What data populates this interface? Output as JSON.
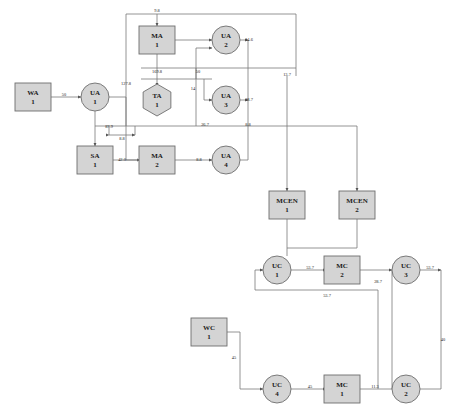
{
  "diagram": {
    "background": "#ffffff",
    "node_fill": "#d4d4d4",
    "node_stroke": "#6e6e6e",
    "edge_color": "#7a7a7a",
    "nodes": [
      {
        "id": "WA1",
        "line1": "WA",
        "line2": "1",
        "shape": "rect",
        "x": 33,
        "y": 97
      },
      {
        "id": "UA1",
        "line1": "UA",
        "line2": "1",
        "shape": "circle",
        "x": 95,
        "y": 97
      },
      {
        "id": "SA1",
        "line1": "SA",
        "line2": "1",
        "shape": "rect",
        "x": 95,
        "y": 160
      },
      {
        "id": "MA1",
        "line1": "MA",
        "line2": "1",
        "shape": "rect",
        "x": 157,
        "y": 40
      },
      {
        "id": "TA1",
        "line1": "TA",
        "line2": "1",
        "shape": "hexagon",
        "x": 157,
        "y": 100
      },
      {
        "id": "MA2",
        "line1": "MA",
        "line2": "2",
        "shape": "rect",
        "x": 157,
        "y": 160
      },
      {
        "id": "UA2",
        "line1": "UA",
        "line2": "2",
        "shape": "circle",
        "x": 226,
        "y": 40
      },
      {
        "id": "UA3",
        "line1": "UA",
        "line2": "3",
        "shape": "circle",
        "x": 226,
        "y": 100
      },
      {
        "id": "UA4",
        "line1": "UA",
        "line2": "4",
        "shape": "circle",
        "x": 226,
        "y": 160
      },
      {
        "id": "MCEN1",
        "line1": "MCEN",
        "line2": "1",
        "shape": "rect",
        "x": 287,
        "y": 205
      },
      {
        "id": "MCEN2",
        "line1": "MCEN",
        "line2": "2",
        "shape": "rect",
        "x": 357,
        "y": 205
      },
      {
        "id": "UC1",
        "line1": "UC",
        "line2": "1",
        "shape": "circle",
        "x": 277,
        "y": 270
      },
      {
        "id": "MC2",
        "line1": "MC",
        "line2": "2",
        "shape": "rect",
        "x": 342,
        "y": 270
      },
      {
        "id": "UC3",
        "line1": "UC",
        "line2": "3",
        "shape": "circle",
        "x": 406,
        "y": 270
      },
      {
        "id": "WC1",
        "line1": "WC",
        "line2": "1",
        "shape": "rect",
        "x": 209,
        "y": 332
      },
      {
        "id": "UC4",
        "line1": "UC",
        "line2": "4",
        "shape": "circle",
        "x": 277,
        "y": 389
      },
      {
        "id": "MC1",
        "line1": "MC",
        "line2": "1",
        "shape": "rect",
        "x": 342,
        "y": 389
      },
      {
        "id": "UC2",
        "line1": "UC",
        "line2": "2",
        "shape": "circle",
        "x": 406,
        "y": 389
      }
    ],
    "edge_labels": [
      {
        "id": "wa1-ua1",
        "text": "50",
        "x": 64,
        "y": 96
      },
      {
        "id": "ma1-top",
        "text": "9.8",
        "x": 157,
        "y": 12
      },
      {
        "id": "left-trunk",
        "text": "127.8",
        "x": 126,
        "y": 85
      },
      {
        "id": "ma1-ta1",
        "text": "169.8",
        "x": 157,
        "y": 73
      },
      {
        "id": "ta1-branch",
        "text": "50",
        "x": 198,
        "y": 73
      },
      {
        "id": "mid-vert",
        "text": "14",
        "x": 193,
        "y": 90
      },
      {
        "id": "ua1-sa1",
        "text": "87.9",
        "x": 109,
        "y": 128
      },
      {
        "id": "sa1-back",
        "text": "8.8",
        "x": 122,
        "y": 140
      },
      {
        "id": "sa1-ma2",
        "text": "42.0",
        "x": 122,
        "y": 161
      },
      {
        "id": "ma2-ua4",
        "text": "8.8",
        "x": 199,
        "y": 161
      },
      {
        "id": "trunk-267",
        "text": "26.7",
        "x": 205,
        "y": 126
      },
      {
        "id": "vert-88",
        "text": "8.8",
        "x": 248,
        "y": 126
      },
      {
        "id": "ua2-out",
        "text": "14.6",
        "x": 249,
        "y": 41
      },
      {
        "id": "ua3-out",
        "text": "18.7",
        "x": 249,
        "y": 101
      },
      {
        "id": "top-137",
        "text": "13.7",
        "x": 287,
        "y": 76
      },
      {
        "id": "uc1-mc2",
        "text": "53.7",
        "x": 310,
        "y": 269
      },
      {
        "id": "mc2-uc3",
        "text": "28.7",
        "x": 378,
        "y": 283
      },
      {
        "id": "uc3-out",
        "text": "53.7",
        "x": 430,
        "y": 269
      },
      {
        "id": "fb-537",
        "text": "53.7",
        "x": 327,
        "y": 297
      },
      {
        "id": "wc1-uc4",
        "text": "45",
        "x": 234,
        "y": 359
      },
      {
        "id": "uc4-mc1",
        "text": "45",
        "x": 310,
        "y": 388
      },
      {
        "id": "mc1-uc2",
        "text": "11.3",
        "x": 375,
        "y": 388
      },
      {
        "id": "right-40",
        "text": "40",
        "x": 443,
        "y": 341
      }
    ]
  }
}
